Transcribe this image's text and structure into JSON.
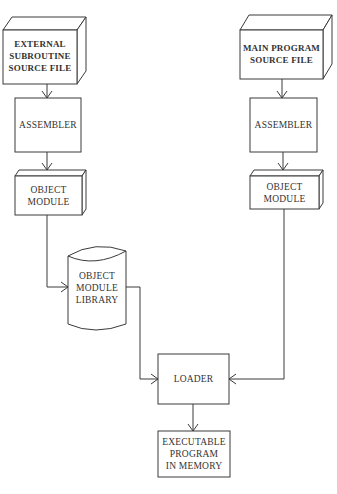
{
  "diagram": {
    "type": "flowchart",
    "nodes": [
      {
        "id": "ext_src",
        "shape": "3d-box",
        "lines": [
          "EXTERNAL",
          "SUBROUTINE",
          "SOURCE FILE"
        ]
      },
      {
        "id": "main_src",
        "shape": "3d-box",
        "lines": [
          "MAIN PROGRAM",
          "SOURCE FILE"
        ]
      },
      {
        "id": "asm_left",
        "shape": "rectangle",
        "lines": [
          "ASSEMBLER"
        ]
      },
      {
        "id": "asm_right",
        "shape": "rectangle",
        "lines": [
          "ASSEMBLER"
        ]
      },
      {
        "id": "obj_left",
        "shape": "3d-box",
        "lines": [
          "OBJECT",
          "MODULE"
        ]
      },
      {
        "id": "obj_right",
        "shape": "3d-box",
        "lines": [
          "OBJECT",
          "MODULE"
        ]
      },
      {
        "id": "library",
        "shape": "cylinder",
        "lines": [
          "OBJECT",
          "MODULE",
          "LIBRARY"
        ]
      },
      {
        "id": "loader",
        "shape": "rectangle",
        "lines": [
          "LOADER"
        ]
      },
      {
        "id": "exec",
        "shape": "rectangle",
        "lines": [
          "EXECUTABLE",
          "PROGRAM",
          "IN MEMORY"
        ]
      }
    ],
    "edges": [
      {
        "from": "ext_src",
        "to": "asm_left"
      },
      {
        "from": "asm_left",
        "to": "obj_left"
      },
      {
        "from": "obj_left",
        "to": "library"
      },
      {
        "from": "library",
        "to": "loader"
      },
      {
        "from": "main_src",
        "to": "asm_right"
      },
      {
        "from": "asm_right",
        "to": "obj_right"
      },
      {
        "from": "obj_right",
        "to": "loader"
      },
      {
        "from": "loader",
        "to": "exec"
      }
    ]
  },
  "colors": {
    "line": "#3a3a3a",
    "text": "#333333",
    "background": "#ffffff"
  }
}
